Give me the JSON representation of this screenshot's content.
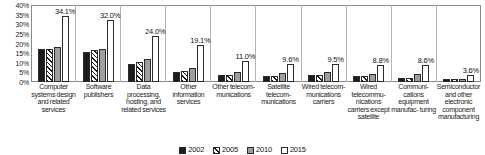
{
  "chart_data": {
    "type": "bar",
    "title": "",
    "xlabel": "",
    "ylabel": "",
    "ylim": [
      0,
      40
    ],
    "ytick_labels": [
      "40%",
      "35%",
      "30%",
      "25%",
      "20%",
      "15%",
      "10%",
      "5%",
      "0%"
    ],
    "ytick_values": [
      40,
      35,
      30,
      25,
      20,
      15,
      10,
      5,
      0
    ],
    "grid": false,
    "legend_position": "bottom-center",
    "categories": [
      "Computer systems design and related services",
      "Software publishers",
      "Data processing, hosting, and related services",
      "Other information services",
      "Other telecom- munications",
      "Satellite telecom- munications",
      "Wired telecom- munications carriers",
      "Wired telecommu- nications carriers except satellite",
      "Communi- cations equipment manufac- turing",
      "Semiconductor and other electronic component manufacturing"
    ],
    "series": [
      {
        "name": "2002",
        "key": "s2002",
        "values": [
          17.0,
          15.8,
          9.5,
          5.2,
          3.6,
          3.2,
          3.4,
          3.0,
          2.0,
          1.4
        ]
      },
      {
        "name": "2005",
        "key": "s2005",
        "values": [
          17.2,
          16.8,
          10.6,
          5.6,
          3.8,
          3.0,
          3.6,
          3.2,
          2.1,
          1.5
        ]
      },
      {
        "name": "2010",
        "key": "s2010",
        "values": [
          18.2,
          17.0,
          12.0,
          7.2,
          5.4,
          4.6,
          5.0,
          4.2,
          4.0,
          1.8
        ]
      },
      {
        "name": "2015",
        "key": "s2015",
        "values": [
          34.1,
          32.0,
          24.0,
          19.1,
          11.0,
          9.6,
          9.5,
          8.8,
          8.6,
          3.6
        ]
      }
    ],
    "data_labels_2015": [
      "34.1%",
      "32.0%",
      "24.0%",
      "19.1%",
      "11.0%",
      "9.6%",
      "9.5%",
      "8.8%",
      "8.6%",
      "3.6%"
    ]
  },
  "legend": {
    "items": [
      {
        "label": "2002",
        "key": "s2002",
        "color": "#1c1c1c"
      },
      {
        "label": "2005",
        "key": "s2005",
        "color": "#1c1c1c"
      },
      {
        "label": "2010",
        "key": "s2010",
        "color": "#9e9e9e"
      },
      {
        "label": "2015",
        "key": "s2015",
        "color": "#ffffff"
      }
    ]
  }
}
